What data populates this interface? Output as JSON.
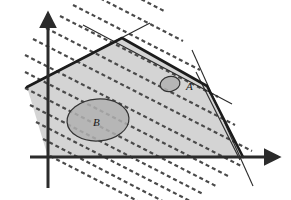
{
  "figure": {
    "title": "",
    "background_color": "#ffffff"
  },
  "colors": {
    "axis": "#2b2b2b",
    "polygon_fill": "#d4d4d4",
    "polygon_edge": "#1c1c1c",
    "thin_line": "#2b2b2b",
    "dashed_line": "#4a4a4a",
    "ellipse_fill": "#b0b0b0",
    "ellipse_edge": "#333333",
    "label_text": "#1a1a1a"
  },
  "axes": {
    "x_axis": {
      "name": "x-axis",
      "x1": 30,
      "y1": 157,
      "x2": 278,
      "y2": 157,
      "arrow": "right",
      "width": 3
    },
    "y_axis": {
      "name": "y-axis",
      "x1": 48,
      "y1": 188,
      "x2": 48,
      "y2": 14,
      "arrow": "up",
      "width": 3
    },
    "origin": {
      "x": 48,
      "y": 157
    }
  },
  "polygon": {
    "name": "feasible-region",
    "fill": "#d4d4d4",
    "stroke": "#1c1c1c",
    "stroke_width": 2.6,
    "points": "27,87 122,38 207,86 243,157 48,157",
    "vertices": [
      {
        "label": "left-edge-point",
        "x": 27,
        "y": 87
      },
      {
        "label": "apex",
        "x": 122,
        "y": 38
      },
      {
        "label": "right-vertex",
        "x": 207,
        "y": 86
      },
      {
        "label": "bottom-right",
        "x": 243,
        "y": 157
      },
      {
        "label": "bottom-left-origin",
        "x": 48,
        "y": 157
      }
    ]
  },
  "thin_lines": [
    {
      "name": "supporting-line-upper-left",
      "x1": 25,
      "y1": 88,
      "x2": 150,
      "y2": 23,
      "width": 1.1
    },
    {
      "name": "supporting-line-upper-right",
      "x1": 83,
      "y1": 25,
      "x2": 232,
      "y2": 104,
      "width": 1.1
    },
    {
      "name": "supporting-line-right-steep",
      "x1": 192,
      "y1": 50,
      "x2": 253,
      "y2": 186,
      "width": 1.1
    },
    {
      "name": "supporting-line-right-shallow",
      "x1": 196,
      "y1": 72,
      "x2": 240,
      "y2": 160,
      "width": 1.1
    }
  ],
  "dashed_lines": {
    "name": "level-contour-lines",
    "color": "#4a4a4a",
    "width": 2.2,
    "dash_pattern": "4 3",
    "direction_deg": 27,
    "count": 13,
    "spacing_px": 15,
    "lines": [
      {
        "x1": 73,
        "y1": 5,
        "x2": 200,
        "y2": 70
      },
      {
        "x1": 60,
        "y1": 16,
        "x2": 218,
        "y2": 97
      },
      {
        "x1": 46,
        "y1": 28,
        "x2": 235,
        "y2": 125
      },
      {
        "x1": 33,
        "y1": 39,
        "x2": 252,
        "y2": 151
      },
      {
        "x1": 25,
        "y1": 55,
        "x2": 243,
        "y2": 167
      },
      {
        "x1": 25,
        "y1": 72,
        "x2": 230,
        "y2": 177
      },
      {
        "x1": 25,
        "y1": 88,
        "x2": 216,
        "y2": 186
      },
      {
        "x1": 30,
        "y1": 105,
        "x2": 203,
        "y2": 194
      },
      {
        "x1": 36,
        "y1": 122,
        "x2": 190,
        "y2": 201
      },
      {
        "x1": 43,
        "y1": 139,
        "x2": 176,
        "y2": 208
      },
      {
        "x1": 50,
        "y1": 156,
        "x2": 163,
        "y2": 214
      },
      {
        "x1": 88,
        "y1": -8,
        "x2": 183,
        "y2": 41
      },
      {
        "x1": 104,
        "y1": -20,
        "x2": 166,
        "y2": 12
      }
    ]
  },
  "ellipses": [
    {
      "name": "ellipse-A",
      "label": "A",
      "cx": 170,
      "cy": 84,
      "rx": 10,
      "ry": 7.5,
      "rotation_deg": -12,
      "fill": "#b0b0b0",
      "stroke": "#333333",
      "label_x": 186,
      "label_y": 90
    },
    {
      "name": "ellipse-B",
      "label": "B",
      "cx": 98,
      "cy": 120,
      "rx": 31,
      "ry": 21,
      "rotation_deg": -4,
      "fill": "#b0b0b0",
      "stroke": "#333333",
      "label_x": 93,
      "label_y": 126
    }
  ]
}
